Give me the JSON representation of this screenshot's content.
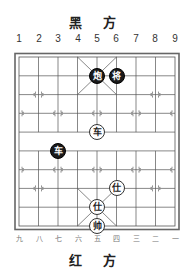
{
  "top_label": "黑 方",
  "bottom_label": "红 方",
  "column_numbers_top": [
    "1",
    "2",
    "3",
    "4",
    "5",
    "6",
    "7",
    "8",
    "9"
  ],
  "column_numbers_bottom": [
    "九",
    "八",
    "七",
    "六",
    "五",
    "四",
    "三",
    "二",
    "一"
  ],
  "colors": {
    "black_piece": "#1a1a1a",
    "red_piece_fill": "#ffffff",
    "grid": "#555555"
  },
  "pieces": [
    {
      "side": "black",
      "label": "炮",
      "col": 5,
      "row": 2
    },
    {
      "side": "black",
      "label": "将",
      "col": 6,
      "row": 2
    },
    {
      "side": "red",
      "label": "车",
      "col": 5,
      "row": 5
    },
    {
      "side": "black",
      "label": "车",
      "col": 3,
      "row": 6
    },
    {
      "side": "red",
      "label": "仕",
      "col": 6,
      "row": 8
    },
    {
      "side": "red",
      "label": "仕",
      "col": 5,
      "row": 9
    },
    {
      "side": "red",
      "label": "帅",
      "col": 5,
      "row": 10
    }
  ]
}
